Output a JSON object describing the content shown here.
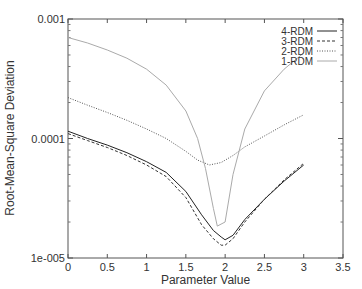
{
  "chart_data": {
    "type": "line",
    "title": "",
    "xlabel": "Parameter Value",
    "ylabel": "Root-Mean-Square Deviation",
    "yscale": "log",
    "xlim": [
      0,
      3.5
    ],
    "ylim": [
      1e-05,
      0.001
    ],
    "x_ticks": [
      0,
      0.5,
      1,
      1.5,
      2,
      2.5,
      3,
      3.5
    ],
    "x_tick_labels": [
      "0",
      "0.5",
      "1",
      "1.5",
      "2",
      "2.5",
      "3",
      "3.5"
    ],
    "y_ticks": [
      1e-05,
      0.0001,
      0.001
    ],
    "y_tick_labels": [
      "1e-005",
      "0.0001",
      "0.001"
    ],
    "grid": false,
    "legend_position": "upper right",
    "series": [
      {
        "name": "4-RDM",
        "style": "solid",
        "color": "#222222",
        "x": [
          0,
          0.25,
          0.5,
          0.75,
          1.0,
          1.25,
          1.5,
          1.7,
          1.85,
          1.95,
          2.0,
          2.1,
          2.25,
          2.5,
          2.75,
          3.0
        ],
        "y": [
          0.000115,
          0.0001,
          8.8e-05,
          7.6e-05,
          6.4e-05,
          5.2e-05,
          3.6e-05,
          2.3e-05,
          1.7e-05,
          1.5e-05,
          1.42e-05,
          1.55e-05,
          2.1e-05,
          3.1e-05,
          4.4e-05,
          6e-05
        ]
      },
      {
        "name": "3-RDM",
        "style": "dashed",
        "color": "#333333",
        "x": [
          0,
          0.25,
          0.5,
          0.75,
          1.0,
          1.25,
          1.5,
          1.7,
          1.85,
          1.95,
          2.0,
          2.1,
          2.25,
          2.5,
          2.75,
          3.0
        ],
        "y": [
          0.00011,
          9.6e-05,
          8.4e-05,
          7.2e-05,
          6e-05,
          4.8e-05,
          3.2e-05,
          1.9e-05,
          1.45e-05,
          1.28e-05,
          1.28e-05,
          1.45e-05,
          2e-05,
          3.1e-05,
          4.5e-05,
          6.2e-05
        ]
      },
      {
        "name": "2-RDM",
        "style": "dotted",
        "color": "#555555",
        "x": [
          0,
          0.25,
          0.5,
          0.75,
          1.0,
          1.25,
          1.5,
          1.65,
          1.8,
          1.95,
          2.1,
          2.25,
          2.5,
          2.75,
          3.0
        ],
        "y": [
          0.00022,
          0.00019,
          0.000165,
          0.000142,
          0.00012,
          0.0001,
          7.8e-05,
          6.6e-05,
          6e-05,
          6.3e-05,
          7.2e-05,
          8.5e-05,
          0.000105,
          0.00013,
          0.000158
        ]
      },
      {
        "name": "1-RDM",
        "style": "solid",
        "color": "#aaaaaa",
        "x": [
          0,
          0.25,
          0.5,
          0.75,
          1.0,
          1.25,
          1.5,
          1.65,
          1.75,
          1.85,
          1.9,
          2.0,
          2.1,
          2.25,
          2.5,
          2.75,
          3.0
        ],
        "y": [
          0.0007,
          0.00063,
          0.00055,
          0.00047,
          0.00038,
          0.00028,
          0.00017,
          0.0001,
          5.6e-05,
          2.6e-05,
          1.85e-05,
          2e-05,
          5e-05,
          0.00012,
          0.00025,
          0.00038,
          0.00052
        ]
      }
    ]
  },
  "legend": {
    "items": [
      {
        "label": "4-RDM"
      },
      {
        "label": "3-RDM"
      },
      {
        "label": "2-RDM"
      },
      {
        "label": "1-RDM"
      }
    ]
  },
  "axes": {
    "xlabel": "Parameter Value",
    "ylabel": "Root-Mean-Square Deviation"
  }
}
